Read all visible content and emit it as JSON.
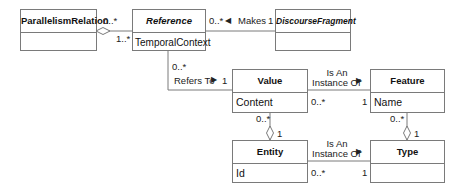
{
  "classes": {
    "parallelism_relation": {
      "name": "ParallelismRelation",
      "attribute": ""
    },
    "reference": {
      "name": "Reference",
      "attribute": "TemporalContext"
    },
    "discourse_fragment": {
      "name": "DiscourseFragment",
      "attribute": ""
    },
    "value": {
      "name": "Value",
      "attribute": "Content"
    },
    "feature": {
      "name": "Feature",
      "attribute": "Name"
    },
    "entity": {
      "name": "Entity",
      "attribute": "Id"
    },
    "type": {
      "name": "Type",
      "attribute": ""
    }
  },
  "associations": {
    "parallelism_reference": {
      "source_multiplicity": "0..*",
      "target_multiplicity": "1..*",
      "kind": "aggregation"
    },
    "reference_discourse": {
      "label": "Makes",
      "direction_glyph": "◀",
      "source_multiplicity": "0..*",
      "target_multiplicity": "1"
    },
    "reference_value": {
      "label": "Refers To",
      "direction_glyph": "▶",
      "source_multiplicity": "0..*",
      "target_multiplicity": "1"
    },
    "value_feature": {
      "label_line1": "Is An",
      "label_line2": "Instance Of",
      "direction_glyph": "▶",
      "source_multiplicity": "0..*",
      "target_multiplicity": "1"
    },
    "value_entity": {
      "source_multiplicity": "0..*",
      "target_multiplicity": "1",
      "kind": "aggregation"
    },
    "feature_type": {
      "source_multiplicity": "0..*",
      "target_multiplicity": "1",
      "kind": "aggregation"
    },
    "entity_type": {
      "label_line1": "Is An",
      "label_line2": "Instance Of",
      "direction_glyph": "▶",
      "source_multiplicity": "0..*",
      "target_multiplicity": "1"
    }
  },
  "colors": {
    "line": "#7a7a7a",
    "text": "#111111",
    "background": "#ffffff"
  }
}
